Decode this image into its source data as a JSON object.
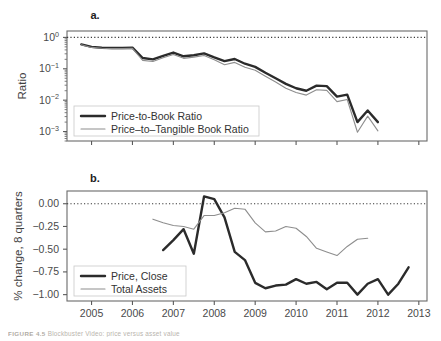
{
  "figure": {
    "caption_label": "FIGURE 4.5",
    "caption_text": "Blockbuster Video: price versus asset value",
    "width": 441,
    "height": 341
  },
  "colors": {
    "primary_series": "#2b2b2b",
    "secondary_series": "#8e8e8e",
    "axis": "#5a5a5a",
    "reference_line": "#3a3a3a",
    "background": "#ffffff"
  },
  "chart_data": [
    {
      "type": "line",
      "panel_label": "a.",
      "title": "",
      "xlabel": "",
      "ylabel": "Ratio",
      "yscale": "log",
      "ylim": [
        0.0005,
        1.6
      ],
      "xlim": [
        2004.4,
        2013.2
      ],
      "grid": false,
      "legend_position": "bottom-left",
      "y_tick_labels": [
        "10^0",
        "10^-1",
        "10^-2",
        "10^-3"
      ],
      "y_tick_values": [
        1,
        0.1,
        0.01,
        0.001
      ],
      "x_tick_labels": [
        "2005",
        "2006",
        "2007",
        "2008",
        "2009",
        "2010",
        "2011",
        "2012",
        "2013"
      ],
      "x_tick_values": [
        2005,
        2006,
        2007,
        2008,
        2009,
        2010,
        2011,
        2012,
        2013
      ],
      "annotations": [
        {
          "text": "reference line at ratio = 1",
          "y": 1,
          "style": "dotted"
        }
      ],
      "series": [
        {
          "name": "Price-to-Book Ratio",
          "style": "thick",
          "x": [
            2004.75,
            2005.0,
            2005.25,
            2005.5,
            2005.75,
            2006.0,
            2006.25,
            2006.5,
            2006.75,
            2007.0,
            2007.25,
            2007.5,
            2007.75,
            2008.0,
            2008.25,
            2008.5,
            2008.75,
            2009.0,
            2009.25,
            2009.5,
            2009.75,
            2010.0,
            2010.25,
            2010.5,
            2010.75,
            2011.0,
            2011.25,
            2011.5,
            2011.75,
            2012.0
          ],
          "values": [
            0.6,
            0.5,
            0.47,
            0.46,
            0.46,
            0.47,
            0.22,
            0.2,
            0.26,
            0.33,
            0.25,
            0.27,
            0.31,
            0.23,
            0.175,
            0.205,
            0.145,
            0.115,
            0.075,
            0.05,
            0.033,
            0.024,
            0.02,
            0.029,
            0.028,
            0.013,
            0.015,
            0.002,
            0.0047,
            0.002,
            0.0088
          ]
        },
        {
          "name": "Price–to–Tangible Book Ratio",
          "style": "thin",
          "x": [
            2004.75,
            2005.0,
            2005.25,
            2005.5,
            2005.75,
            2006.0,
            2006.25,
            2006.5,
            2006.75,
            2007.0,
            2007.25,
            2007.5,
            2007.75,
            2008.0,
            2008.25,
            2008.5,
            2008.75,
            2009.0,
            2009.25,
            2009.5,
            2009.75,
            2010.0,
            2010.25,
            2010.5,
            2010.75,
            2011.0,
            2011.25,
            2011.5,
            2011.75,
            2012.0
          ],
          "values": [
            0.58,
            0.48,
            0.45,
            0.44,
            0.44,
            0.45,
            0.185,
            0.17,
            0.225,
            0.285,
            0.215,
            0.235,
            0.265,
            0.195,
            0.135,
            0.16,
            0.112,
            0.09,
            0.058,
            0.038,
            0.024,
            0.0175,
            0.0145,
            0.0215,
            0.0205,
            0.009,
            0.0105,
            0.00095,
            0.0031,
            0.00105,
            0.005
          ]
        }
      ]
    },
    {
      "type": "line",
      "panel_label": "b.",
      "title": "",
      "xlabel": "",
      "ylabel": "% change, 8 quarters",
      "yscale": "linear",
      "ylim": [
        -1.07,
        0.14
      ],
      "xlim": [
        2004.4,
        2013.2
      ],
      "grid": false,
      "legend_position": "bottom-left",
      "y_tick_labels": [
        "0.00",
        "−0.25",
        "−0.50",
        "−0.75",
        "−1.00"
      ],
      "y_tick_values": [
        0.0,
        -0.25,
        -0.5,
        -0.75,
        -1.0
      ],
      "x_tick_labels": [
        "2005",
        "2006",
        "2007",
        "2008",
        "2009",
        "2010",
        "2011",
        "2012",
        "2013"
      ],
      "x_tick_values": [
        2005,
        2006,
        2007,
        2008,
        2009,
        2010,
        2011,
        2012,
        2013
      ],
      "annotations": [
        {
          "text": "reference line at 0.00",
          "y": 0,
          "style": "dotted"
        }
      ],
      "series": [
        {
          "name": "Price, Close",
          "style": "thick",
          "x": [
            2006.75,
            2007.0,
            2007.25,
            2007.5,
            2007.75,
            2008.0,
            2008.25,
            2008.5,
            2008.75,
            2009.0,
            2009.25,
            2009.5,
            2009.75,
            2010.0,
            2010.25,
            2010.5,
            2010.75,
            2011.0,
            2011.25,
            2011.5,
            2011.75,
            2012.0,
            2012.25,
            2012.5,
            2012.75
          ],
          "values": [
            -0.51,
            -0.4,
            -0.28,
            -0.55,
            0.08,
            0.05,
            -0.15,
            -0.53,
            -0.62,
            -0.87,
            -0.93,
            -0.9,
            -0.89,
            -0.83,
            -0.88,
            -0.86,
            -0.94,
            -0.87,
            -0.87,
            -1.0,
            -0.88,
            -0.83,
            -1.0,
            -0.88,
            -0.7
          ]
        },
        {
          "name": "Total Assets",
          "style": "thin",
          "x": [
            2006.5,
            2006.75,
            2007.0,
            2007.25,
            2007.5,
            2007.75,
            2008.0,
            2008.25,
            2008.5,
            2008.75,
            2009.0,
            2009.25,
            2009.5,
            2009.75,
            2010.0,
            2010.25,
            2010.5,
            2010.75,
            2011.0,
            2011.25,
            2011.5,
            2011.75
          ],
          "values": [
            -0.17,
            -0.21,
            -0.24,
            -0.25,
            -0.28,
            -0.13,
            -0.13,
            -0.1,
            -0.05,
            -0.06,
            -0.21,
            -0.31,
            -0.3,
            -0.25,
            -0.27,
            -0.36,
            -0.49,
            -0.53,
            -0.57,
            -0.47,
            -0.39,
            -0.38
          ]
        }
      ]
    }
  ]
}
